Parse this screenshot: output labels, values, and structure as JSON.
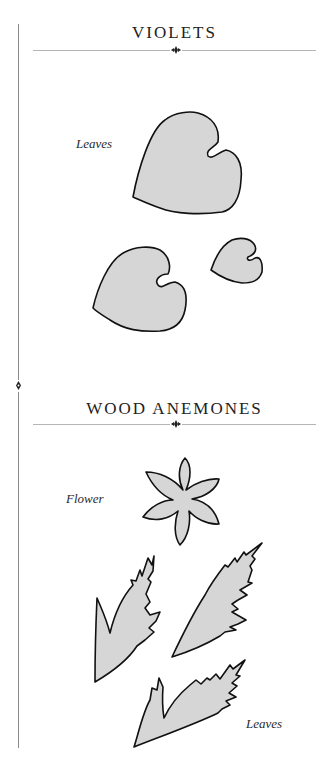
{
  "sections": [
    {
      "title": "VIOLETS",
      "labels": [
        "Leaves"
      ],
      "shapes": [
        "violet-leaf-large",
        "violet-leaf-medium",
        "violet-leaf-small"
      ]
    },
    {
      "title": "WOOD ANEMONES",
      "labels": [
        "Flower",
        "Leaves"
      ],
      "shapes": [
        "anemone-flower",
        "anemone-leaf-left",
        "anemone-leaf-right",
        "anemone-leaf-bottom"
      ]
    }
  ],
  "colors": {
    "shape_fill": "#d6d6d6",
    "outline": "#111111",
    "rule": "#b5b5b5"
  }
}
